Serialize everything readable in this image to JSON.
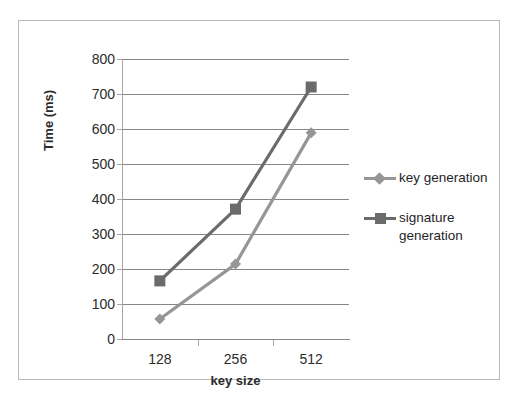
{
  "chart_data": {
    "type": "line",
    "title": "",
    "xlabel": "key size",
    "ylabel": "Time  (ms)",
    "categories": [
      "128",
      "256",
      "512"
    ],
    "x": [
      128,
      256,
      512
    ],
    "ylim": [
      0,
      800
    ],
    "yticks": [
      0,
      100,
      200,
      300,
      400,
      500,
      600,
      700,
      800
    ],
    "ytick_labels": [
      "0",
      "100",
      "200",
      "300",
      "400",
      "500",
      "600",
      "700",
      "800"
    ],
    "grid": "horizontal",
    "legend_position": "right",
    "series": [
      {
        "name": "key generation",
        "marker": "diamond",
        "color": "#969696",
        "values": [
          57,
          214,
          589
        ]
      },
      {
        "name": "signature generation",
        "marker": "square",
        "color": "#6b6b6b",
        "values": [
          166,
          371,
          720
        ]
      }
    ]
  },
  "legend": {
    "items": [
      {
        "label": "key generation",
        "label_line2": ""
      },
      {
        "label": "signature",
        "label_line2": "generation"
      }
    ]
  },
  "colors": {
    "key_generation": "#969696",
    "signature_generation": "#6b6b6b",
    "gridline": "#868686",
    "axis": "#a6a6a6",
    "border": "#b9b9b9",
    "text": "#2b2b2b",
    "background": "#ffffff"
  }
}
